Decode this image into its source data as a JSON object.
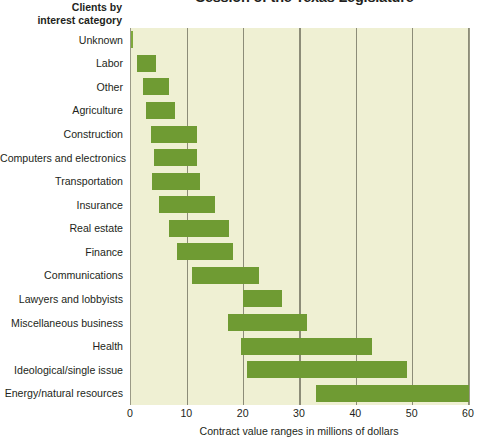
{
  "title": "Session of the Texas Legislature",
  "y_axis_heading": "Clients by\ninterest category",
  "y_axis_heading_line1": "Clients by",
  "y_axis_heading_line2": "interest category",
  "x_axis_title": "Contract value ranges in millions of dollars",
  "colors": {
    "bar": "#6f9b33",
    "plot_background": "#eff0d3",
    "gridline": "#8c8c78",
    "text": "#231f20"
  },
  "chart_data": {
    "type": "bar",
    "orientation": "horizontal",
    "bar_style": "range",
    "title": "Session of the Texas Legislature",
    "xlabel": "Contract value ranges in millions of dollars",
    "ylabel": "Clients by interest category",
    "xlim": [
      0,
      60
    ],
    "xticks": [
      0,
      10,
      20,
      30,
      40,
      50,
      60
    ],
    "xtick_labels": [
      "0",
      "10",
      "20",
      "30",
      "40",
      "50",
      "60"
    ],
    "grid": true,
    "grid_axis": "x",
    "legend": false,
    "categories": [
      "Unknown",
      "Labor",
      "Other",
      "Agriculture",
      "Construction",
      "Computers and electronics",
      "Transportation",
      "Insurance",
      "Real estate",
      "Finance",
      "Communications",
      "Lawyers and lobbyists",
      "Miscellaneous business",
      "Health",
      "Ideological/single issue",
      "Energy/natural resources"
    ],
    "ranges": [
      {
        "category": "Unknown",
        "low": 0.0,
        "high": 0.4
      },
      {
        "category": "Labor",
        "low": 1.0,
        "high": 4.5
      },
      {
        "category": "Other",
        "low": 2.2,
        "high": 6.7
      },
      {
        "category": "Agriculture",
        "low": 2.7,
        "high": 7.8
      },
      {
        "category": "Construction",
        "low": 3.6,
        "high": 11.7
      },
      {
        "category": "Computers and electronics",
        "low": 4.0,
        "high": 11.8
      },
      {
        "category": "Transportation",
        "low": 3.8,
        "high": 12.3
      },
      {
        "category": "Insurance",
        "low": 5.0,
        "high": 14.9
      },
      {
        "category": "Real estate",
        "low": 6.7,
        "high": 17.4
      },
      {
        "category": "Finance",
        "low": 8.2,
        "high": 18.1
      },
      {
        "category": "Communications",
        "low": 10.8,
        "high": 22.7
      },
      {
        "category": "Lawyers and lobbyists",
        "low": 19.9,
        "high": 26.8
      },
      {
        "category": "Miscellaneous business",
        "low": 17.2,
        "high": 31.3
      },
      {
        "category": "Health",
        "low": 19.6,
        "high": 42.8
      },
      {
        "category": "Ideological/single issue",
        "low": 20.6,
        "high": 49.0
      },
      {
        "category": "Energy/natural resources",
        "low": 32.9,
        "high": 60.0
      }
    ],
    "units": "millions of dollars"
  }
}
